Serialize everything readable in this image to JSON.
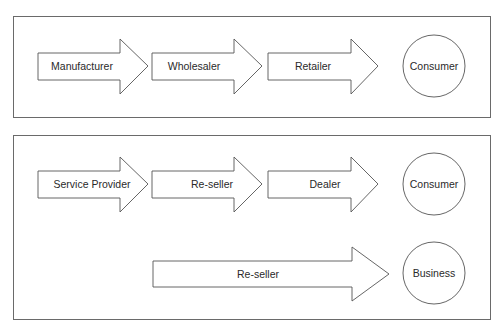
{
  "diagram": {
    "type": "distribution-channels",
    "panels": [
      {
        "name": "top-panel",
        "rows": [
          {
            "arrows": [
              {
                "label": "Manufacturer"
              },
              {
                "label": "Wholesaler"
              },
              {
                "label": "Retailer"
              }
            ],
            "endpoint": {
              "label": "Consumer"
            }
          }
        ]
      },
      {
        "name": "bottom-panel",
        "rows": [
          {
            "arrows": [
              {
                "label": "Service Provider"
              },
              {
                "label": "Re-seller"
              },
              {
                "label": "Dealer"
              }
            ],
            "endpoint": {
              "label": "Consumer"
            }
          },
          {
            "arrows": [
              {
                "label": "Re-seller"
              }
            ],
            "endpoint": {
              "label": "Business"
            }
          }
        ]
      }
    ],
    "colors": {
      "stroke": "#555555",
      "text": "#2a2a2a",
      "background": "#ffffff"
    }
  }
}
